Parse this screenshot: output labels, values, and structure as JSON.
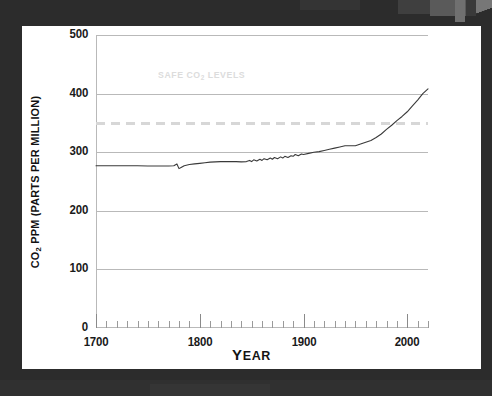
{
  "chart_data": {
    "type": "line",
    "title": "",
    "xlabel": "YEAR",
    "ylabel": "CO2 PPM (PARTS PER MILLION)",
    "ylabel_parts": {
      "pre": "CO",
      "sub": "2",
      "post": " PPM (PARTS PER MILLION)"
    },
    "xlim": [
      1700,
      2020
    ],
    "ylim": [
      0,
      500
    ],
    "grid": "horizontal",
    "legend": "none",
    "y_ticks": [
      0,
      100,
      200,
      300,
      400,
      500
    ],
    "y_tick_labels": [
      "0",
      "100",
      "200",
      "300",
      "400",
      "500"
    ],
    "x_ticks": [
      1700,
      1800,
      1900,
      2000
    ],
    "x_tick_labels": [
      "1700",
      "1800",
      "1900",
      "2000"
    ],
    "x_minor_tick_step": 10,
    "annotations": [
      {
        "name": "safe-co2-levels",
        "text": "SAFE CO2 LEVELS",
        "text_parts": {
          "pre": "SAFE CO",
          "sub": "2",
          "post": " LEVELS"
        },
        "x": 1760,
        "y": 432,
        "color": "#dcdcdc"
      }
    ],
    "reference_lines": [
      {
        "name": "safe-threshold",
        "value": 350,
        "style": "dashed",
        "color": "#d7d7d7",
        "orientation": "horizontal"
      }
    ],
    "series": [
      {
        "name": "Atmospheric CO2",
        "color": "#3a3a3a",
        "x": [
          1700,
          1710,
          1720,
          1730,
          1740,
          1750,
          1760,
          1770,
          1775,
          1778,
          1780,
          1782,
          1785,
          1790,
          1795,
          1800,
          1805,
          1810,
          1815,
          1820,
          1825,
          1830,
          1835,
          1840,
          1845,
          1848,
          1850,
          1852,
          1855,
          1858,
          1860,
          1862,
          1865,
          1868,
          1870,
          1872,
          1875,
          1878,
          1880,
          1882,
          1885,
          1888,
          1890,
          1892,
          1895,
          1898,
          1900,
          1905,
          1910,
          1915,
          1920,
          1925,
          1930,
          1935,
          1940,
          1945,
          1950,
          1955,
          1960,
          1965,
          1970,
          1975,
          1980,
          1985,
          1990,
          1995,
          2000,
          2005,
          2010,
          2015,
          2020
        ],
        "y": [
          277,
          277,
          277,
          277,
          277,
          276.5,
          276.5,
          276.5,
          277,
          280,
          272,
          274,
          277,
          279,
          280,
          281,
          282,
          283,
          283.5,
          284,
          284,
          284,
          284,
          283.5,
          284,
          286,
          284,
          287,
          285,
          288,
          286,
          289,
          287,
          290,
          288,
          291,
          289,
          292,
          290,
          293,
          291,
          294,
          293,
          296,
          294,
          297,
          296,
          298,
          300,
          301,
          303,
          305,
          307,
          309,
          311,
          311,
          311,
          314,
          317,
          320,
          325,
          331,
          339,
          346,
          354,
          361,
          369,
          379,
          389,
          400,
          408
        ]
      }
    ]
  },
  "colors": {
    "background": "#2c2c2c",
    "card": "#ffffff",
    "grid": "#b9b9b9",
    "text": "#141414",
    "curve": "#3a3a3a",
    "annotation": "#dcdcdc"
  }
}
